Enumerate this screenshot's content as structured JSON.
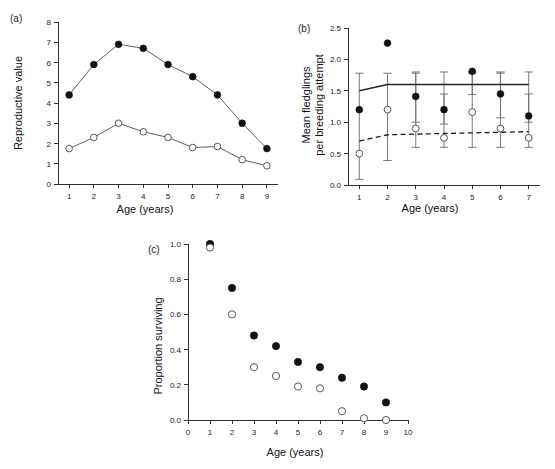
{
  "figure": {
    "panels": [
      {
        "label": "(a)",
        "xlabel": "Age (years)",
        "ylabel": "Reproductive value"
      },
      {
        "label": "(b)",
        "xlabel": "Age (years)",
        "ylabel_line1": "Mean fledglings",
        "ylabel_line2": "per breeding attempt"
      },
      {
        "label": "(c)",
        "xlabel": "Age (years)",
        "ylabel": "Proportion surviving"
      }
    ]
  },
  "chart_data": [
    {
      "type": "line",
      "panel": "(a)",
      "title": "Reproductive value by age",
      "xlabel": "Age (years)",
      "ylabel": "Reproductive value",
      "x": [
        1,
        2,
        3,
        4,
        5,
        6,
        7,
        8,
        9
      ],
      "xticks": [
        1,
        2,
        3,
        4,
        5,
        6,
        7,
        8,
        9
      ],
      "yticks": [
        0,
        1,
        2,
        3,
        4,
        5,
        6,
        7,
        8
      ],
      "xlim": [
        0.55,
        9.45
      ],
      "ylim": [
        0,
        8
      ],
      "grid": false,
      "legend": false,
      "series": [
        {
          "name": "filled-circles",
          "marker": "filled circle",
          "values": [
            4.4,
            5.9,
            6.9,
            6.7,
            5.9,
            5.3,
            4.4,
            3.0,
            1.75
          ]
        },
        {
          "name": "open-circles",
          "marker": "open circle",
          "values": [
            1.75,
            2.3,
            3.0,
            2.58,
            2.3,
            1.8,
            1.85,
            1.2,
            0.9
          ]
        }
      ]
    },
    {
      "type": "scatter",
      "panel": "(b)",
      "title": "Mean fledglings per breeding attempt by age",
      "xlabel": "Age (years)",
      "ylabel": "Mean fledglings per breeding attempt",
      "x": [
        1,
        2,
        3,
        4,
        5,
        6,
        7
      ],
      "xticks": [
        1,
        2,
        3,
        4,
        5,
        6,
        7
      ],
      "yticks": [
        0.0,
        0.5,
        1.0,
        1.5,
        2.0,
        2.5
      ],
      "ytick_labels": [
        "0.0",
        "0.5",
        "1.0",
        "1.5",
        "2.0",
        "2.5"
      ],
      "xlim": [
        0.6,
        7.4
      ],
      "ylim": [
        0,
        2.5
      ],
      "grid": false,
      "legend": false,
      "series": [
        {
          "name": "filled-circles",
          "marker": "filled circle",
          "values": [
            1.2,
            2.26,
            1.41,
            1.2,
            1.81,
            1.45,
            1.1
          ],
          "err_low": [
            null,
            null,
            1.0,
            0.97,
            1.44,
            1.07,
            1.0
          ],
          "err_high": [
            null,
            null,
            1.8,
            1.8,
            1.8,
            1.8,
            1.8
          ]
        },
        {
          "name": "open-circles",
          "marker": "open circle",
          "values": [
            0.5,
            1.2,
            0.9,
            0.75,
            1.16,
            0.9,
            0.75
          ],
          "err_low": [
            0.09,
            0.39,
            0.6,
            0.6,
            0.6,
            0.6,
            0.6
          ],
          "err_high": [
            1.78,
            1.78,
            1.78,
            1.45,
            1.78,
            1.78,
            1.45
          ]
        },
        {
          "name": "fitted-solid-line",
          "marker": "solid line",
          "values": [
            1.5,
            1.6,
            1.6,
            1.6,
            1.6,
            1.6,
            1.6
          ]
        },
        {
          "name": "fitted-dashed-line",
          "marker": "dashed line",
          "values": [
            0.7,
            0.8,
            0.81,
            0.82,
            0.83,
            0.84,
            0.85
          ]
        }
      ]
    },
    {
      "type": "scatter",
      "panel": "(c)",
      "title": "Proportion surviving by age",
      "xlabel": "Age (years)",
      "ylabel": "Proportion surviving",
      "x": [
        1,
        2,
        3,
        4,
        5,
        6,
        7,
        8,
        9
      ],
      "xticks": [
        0,
        1,
        2,
        3,
        4,
        5,
        6,
        7,
        8,
        9,
        10
      ],
      "yticks": [
        0.0,
        0.2,
        0.4,
        0.6,
        0.8,
        1.0
      ],
      "ytick_labels": [
        "0.0",
        "0.2",
        "0.4",
        "0.6",
        "0.8",
        "1.0"
      ],
      "xlim": [
        0,
        10
      ],
      "ylim": [
        0,
        1.0
      ],
      "grid": false,
      "legend": false,
      "series": [
        {
          "name": "filled-circles",
          "marker": "filled circle",
          "values": [
            1.0,
            0.75,
            0.48,
            0.42,
            0.33,
            0.3,
            0.24,
            0.19,
            0.1
          ]
        },
        {
          "name": "open-circles",
          "marker": "open circle",
          "values": [
            0.98,
            0.6,
            0.3,
            0.25,
            0.19,
            0.18,
            0.05,
            0.01,
            0.0
          ]
        }
      ]
    }
  ]
}
